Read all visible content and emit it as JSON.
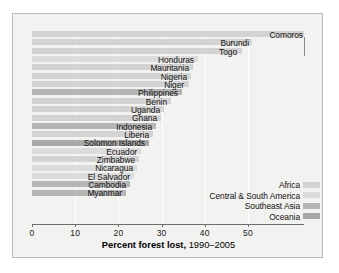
{
  "chart_data": {
    "type": "bar",
    "orientation": "horizontal",
    "title": "",
    "xlabel_bold": "Percent forest lost,",
    "xlabel_regular": "1990–2005",
    "ylabel": "",
    "xlim": [
      0,
      56
    ],
    "xticks": [
      0,
      10,
      20,
      30,
      40,
      50
    ],
    "xticklabels": [
      "0",
      "10",
      "20",
      "30",
      "40",
      "50"
    ],
    "grid": "vertical-white",
    "legend_position": "inside-lower-right",
    "categories": [
      "Comoros",
      "Burundi",
      "Togo",
      "Honduras",
      "Mauritania",
      "Nigeria",
      "Niger",
      "Philippines",
      "Benin",
      "Uganda",
      "Ghana",
      "Indonesia",
      "Liberia",
      "Solomon Islands",
      "Ecuador",
      "Zimbabwe",
      "Nicaragua",
      "El Salvador",
      "Cambodia",
      "Myanmar"
    ],
    "values": [
      63.0,
      51.0,
      48.5,
      38.5,
      37.3,
      36.8,
      36.3,
      34.8,
      32.2,
      30.5,
      29.8,
      28.6,
      28.0,
      27.0,
      25.2,
      24.7,
      24.2,
      23.5,
      22.6,
      21.7
    ],
    "region_by_category": [
      "Africa",
      "Africa",
      "Africa",
      "Central & South America",
      "Africa",
      "Africa",
      "Africa",
      "Southeast Asia",
      "Africa",
      "Africa",
      "Africa",
      "Southeast Asia",
      "Africa",
      "Oceania",
      "Central & South America",
      "Africa",
      "Central & South America",
      "Central & South America",
      "Southeast Asia",
      "Southeast Asia"
    ],
    "legend": [
      {
        "label": "Africa",
        "color": "#d3d3d3"
      },
      {
        "label": "Central & South America",
        "color": "#dcdcdc"
      },
      {
        "label": "Southeast Asia",
        "color": "#b5b5b5"
      },
      {
        "label": "Oceania",
        "color": "#a8a8a8"
      }
    ]
  },
  "axis": {
    "tick_labels": [
      "0",
      "10",
      "20",
      "30",
      "40",
      "50"
    ]
  },
  "bars": [
    {
      "label": "Comoros",
      "value": 63.0,
      "color": "#d3d3d3",
      "label_right": 290,
      "leader": true
    },
    {
      "label": "Burundi",
      "value": 51.0,
      "color": "#d3d3d3",
      "label_right": 236,
      "leader": false
    },
    {
      "label": "Togo",
      "value": 48.5,
      "color": "#d3d3d3",
      "label_right": 224,
      "leader": false
    },
    {
      "label": "Honduras",
      "value": 38.5,
      "color": "#dcdcdc",
      "label_right": 181,
      "leader": false
    },
    {
      "label": "Mauritania",
      "value": 37.3,
      "color": "#d3d3d3",
      "label_right": 176,
      "leader": false
    },
    {
      "label": "Nigeria",
      "value": 36.8,
      "color": "#d3d3d3",
      "label_right": 174,
      "leader": false
    },
    {
      "label": "Niger",
      "value": 36.3,
      "color": "#d3d3d3",
      "label_right": 171,
      "leader": false
    },
    {
      "label": "Philippines",
      "value": 34.8,
      "color": "#b5b5b5",
      "label_right": 165,
      "leader": false
    },
    {
      "label": "Benin",
      "value": 32.2,
      "color": "#d3d3d3",
      "label_right": 154,
      "leader": false
    },
    {
      "label": "Uganda",
      "value": 30.5,
      "color": "#d3d3d3",
      "label_right": 147,
      "leader": false
    },
    {
      "label": "Ghana",
      "value": 29.8,
      "color": "#d3d3d3",
      "label_right": 144,
      "leader": false
    },
    {
      "label": "Indonesia",
      "value": 28.6,
      "color": "#b5b5b5",
      "label_right": 139,
      "leader": false
    },
    {
      "label": "Liberia",
      "value": 28.0,
      "color": "#d3d3d3",
      "label_right": 136,
      "leader": false
    },
    {
      "label": "Solomon Islands",
      "value": 27.0,
      "color": "#a8a8a8",
      "label_right": 132,
      "leader": false
    },
    {
      "label": "Ecuador",
      "value": 25.2,
      "color": "#dcdcdc",
      "label_right": 124,
      "leader": false
    },
    {
      "label": "Zimbabwe",
      "value": 24.7,
      "color": "#d3d3d3",
      "label_right": 122,
      "leader": false
    },
    {
      "label": "Nicaragua",
      "value": 24.2,
      "color": "#dcdcdc",
      "label_right": 120,
      "leader": false
    },
    {
      "label": "El Salvador",
      "value": 23.5,
      "color": "#dcdcdc",
      "label_right": 117,
      "leader": false
    },
    {
      "label": "Cambodia",
      "value": 22.6,
      "color": "#b5b5b5",
      "label_right": 113,
      "leader": false
    },
    {
      "label": "Myanmar",
      "value": 21.7,
      "color": "#b5b5b5",
      "label_right": 109,
      "leader": false
    }
  ],
  "legend": [
    {
      "label": "Africa",
      "color": "#d3d3d3"
    },
    {
      "label": "Central & South America",
      "color": "#dcdcdc"
    },
    {
      "label": "Southeast Asia",
      "color": "#b5b5b5"
    },
    {
      "label": "Oceania",
      "color": "#a8a8a8"
    }
  ]
}
